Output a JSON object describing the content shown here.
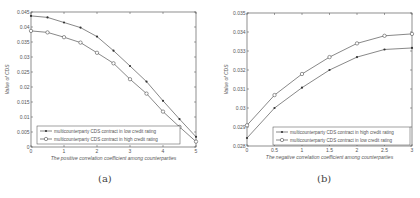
{
  "captions": {
    "a": "(a)",
    "b": "(b)"
  },
  "chart_data": [
    {
      "type": "line",
      "panel": "(a)",
      "title": "",
      "xlabel": "The positive correlation coefficient among counterparties",
      "ylabel": "Value of CDS",
      "xlim": [
        0,
        5
      ],
      "ylim": [
        0,
        0.045
      ],
      "xticks": [
        0,
        1,
        2,
        3,
        4,
        5
      ],
      "xtick_labels": [
        "0",
        "1",
        "2",
        "3",
        "4",
        "5"
      ],
      "yticks": [
        0,
        0.005,
        0.01,
        0.015,
        0.02,
        0.025,
        0.03,
        0.035,
        0.04,
        0.045
      ],
      "ytick_labels": [
        "0",
        "0.005",
        "0.01",
        "0.015",
        "0.02",
        "0.025",
        "0.03",
        "0.035",
        "0.04",
        "0.045"
      ],
      "grid": false,
      "legend_position": "lower left",
      "x": [
        0,
        0.5,
        1,
        1.5,
        2,
        2.5,
        3,
        3.5,
        4,
        4.5,
        5
      ],
      "series": [
        {
          "name": "multicounterparty CDS contract in low credit rating",
          "marker": "filled-dot",
          "values": [
            0.0437,
            0.0432,
            0.0415,
            0.0398,
            0.0368,
            0.0321,
            0.027,
            0.0218,
            0.0154,
            0.0093,
            0.0034
          ]
        },
        {
          "name": "multicounterparty CDS contract in high credit rating",
          "marker": "open-circle",
          "values": [
            0.0387,
            0.0382,
            0.0366,
            0.0348,
            0.0314,
            0.0279,
            0.0226,
            0.0178,
            0.0118,
            0.0067,
            0.0018
          ]
        }
      ]
    },
    {
      "type": "line",
      "panel": "(b)",
      "title": "",
      "xlabel": "The negative correlation coefficient among counterparties",
      "ylabel": "Value of CDS",
      "xlim": [
        0,
        3
      ],
      "ylim": [
        0.028,
        0.035
      ],
      "xticks": [
        0,
        0.5,
        1,
        1.5,
        2,
        2.5,
        3
      ],
      "xtick_labels": [
        "0",
        "0.5",
        "1",
        "1.5",
        "2",
        "2.5",
        "3"
      ],
      "yticks": [
        0.028,
        0.029,
        0.03,
        0.031,
        0.032,
        0.033,
        0.034,
        0.035
      ],
      "ytick_labels": [
        "0.028",
        "0.029",
        "0.03",
        "0.031",
        "0.032",
        "0.033",
        "0.034",
        "0.035"
      ],
      "grid": false,
      "legend_position": "lower right",
      "x": [
        0,
        0.5,
        1,
        1.5,
        2,
        2.5,
        3
      ],
      "series": [
        {
          "name": "multicounterparty CDS contract in high credit rating",
          "marker": "filled-dot",
          "values": [
            0.02842,
            0.03,
            0.03107,
            0.032,
            0.03268,
            0.03308,
            0.03316
          ]
        },
        {
          "name": "multicounterparty CDS contract in low credit rating",
          "marker": "open-circle",
          "values": [
            0.02909,
            0.03068,
            0.03179,
            0.03268,
            0.0334,
            0.0338,
            0.0339
          ]
        }
      ]
    }
  ],
  "layout": {
    "panels": [
      {
        "left": 31,
        "top": 12,
        "right": 196,
        "bottom": 147,
        "legend": {
          "x": 37,
          "y": 126,
          "w": 143,
          "h": 18
        },
        "ylabel_x": 9
      },
      {
        "left": 247,
        "top": 13,
        "right": 412,
        "bottom": 146,
        "legend": {
          "x": 273,
          "y": 127,
          "w": 137,
          "h": 18
        },
        "ylabel_x": 228
      }
    ],
    "colors": {
      "axis": "#444444",
      "line": "#555555",
      "marker": "#333333"
    }
  }
}
